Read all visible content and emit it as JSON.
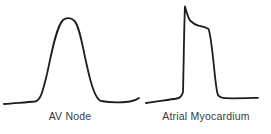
{
  "figure": {
    "background_color": "#ffffff",
    "trace_color": "#1d1d1d",
    "label_color": "#3a3a3a",
    "panels": [
      {
        "id": "av-node",
        "label": "AV Node",
        "waveform_shape": "slow-response action potential: broad rounded hump rising smoothly from baseline and returning to baseline",
        "path": "M4,104 C14,103 26,102.5 35,101.5 C41,100.5 43,90 47,74 C51,56 56,27 63,20 C66,17.5 71,17.5 74,20.5 C80,26 83,50 87,66 C90,80 95,99.5 101,101 C109,102.5 122,102.5 130,101.5 C134,101 137,99.5 139,98"
      },
      {
        "id": "atrial-myocardium",
        "label": "Atrial Myocardium",
        "waveform_shape": "fast-response action potential: sharp vertical upstroke to a peaked spike, early repolarization notch easing into a short plateau, then steep repolarization back to flat baseline",
        "path": "M146,103 C154,101.5 168,100 177,98.5 C180,98 182,96 183,92 C183.8,60 184.2,20 185,6.5 C186,10 187.5,16 190,20.5 C193,23.5 196,25 199,25.8 C203,26.8 206,27.5 208.5,29 C210.5,34 212,48 213.5,62 C215,76 216,90 218,95 C219.5,97.5 222,98 226,98.2 C236,98.5 250,98 258,97.8"
      }
    ]
  }
}
